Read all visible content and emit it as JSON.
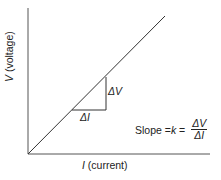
{
  "diagram": {
    "y_axis_label_var": "V",
    "y_axis_label_text": " (voltage)",
    "x_axis_label_var": "I",
    "x_axis_label_text": " (current)",
    "delta_v": "ΔV",
    "delta_i": "ΔI",
    "slope_prefix": "Slope = ",
    "slope_var": "k",
    "slope_eq": " = ",
    "fraction_numerator": "ΔV",
    "fraction_denominator": "ΔI",
    "colors": {
      "line": "#333333",
      "axis": "#555555",
      "background": "#ffffff"
    }
  }
}
